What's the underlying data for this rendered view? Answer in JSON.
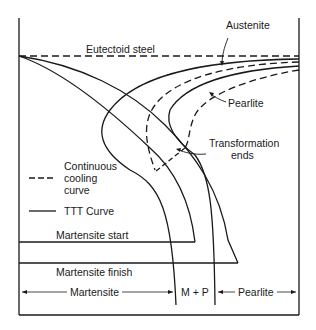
{
  "diagram": {
    "title": "",
    "labels": {
      "austenite": "Austenite",
      "eutectoid": "Eutectoid steel",
      "pearlite": "Pearlite",
      "transformation_ends_1": "Transformation",
      "transformation_ends_2": "ends",
      "legend_ccc_1": "Continuous",
      "legend_ccc_2": "cooling",
      "legend_ccc_3": "curve",
      "legend_ttt": "TTT Curve",
      "martensite_start": "Martensite start",
      "martensite_finish": "Martensite finish",
      "region_martensite": "Martensite",
      "region_mp": "M + P",
      "region_pearlite": "Pearlite"
    },
    "legend": [
      {
        "style": "dashed",
        "label": "Continuous cooling curve"
      },
      {
        "style": "solid",
        "label": "TTT Curve"
      }
    ],
    "colors": {
      "line": "#1a1a1a",
      "background": "#ffffff"
    }
  }
}
